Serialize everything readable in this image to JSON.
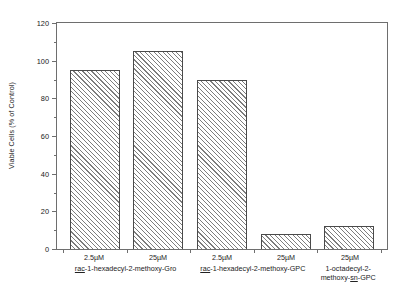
{
  "chart_data": {
    "type": "bar",
    "title": "",
    "subtitle": "",
    "xlabel": "",
    "ylabel": "Viable Cells (% of Control)",
    "ylim": [
      0,
      120
    ],
    "yticks": [
      0,
      20,
      40,
      60,
      80,
      100,
      120
    ],
    "ytick_labels": [
      "0",
      "20",
      "40",
      "60",
      "80",
      "100",
      "120"
    ],
    "grid": false,
    "legend": "none",
    "categories": [
      "2.5µM",
      "25µM",
      "2.5µM",
      "25µM",
      "25µM"
    ],
    "values": [
      95,
      105,
      90,
      8,
      12
    ],
    "bar_fill": "hatched-diagonal",
    "series": [
      {
        "name": "Viable Cells (% of Control)",
        "values": [
          95,
          105,
          90,
          8,
          12
        ]
      }
    ],
    "points": [
      {
        "dose": "2.5µM",
        "compound": "rac-1-hexadecyl-2-methoxy-Gro",
        "value": 95
      },
      {
        "dose": "25µM",
        "compound": "rac-1-hexadecyl-2-methoxy-Gro",
        "value": 105
      },
      {
        "dose": "2.5µM",
        "compound": "rac-1-hexadecyl-2-methoxy-GPC",
        "value": 90
      },
      {
        "dose": "25µM",
        "compound": "rac-1-hexadecyl-2-methoxy-GPC",
        "value": 8
      },
      {
        "dose": "25µM",
        "compound": "1-octadecyl-2-methoxy-sn-GPC",
        "value": 12
      }
    ],
    "groups": [
      {
        "label_prefix": "rac",
        "label_rest": "-1-hexadecyl-2-methoxy-Gro",
        "label_full": "rac-1-hexadecyl-2-methoxy-Gro",
        "doses": [
          "2.5µM",
          "25µM"
        ]
      },
      {
        "label_prefix": "rac",
        "label_rest": "-1-hexadecyl-2-methoxy-GPC",
        "label_full": "rac-1-hexadecyl-2-methoxy-GPC",
        "doses": [
          "2.5µM",
          "25µM"
        ]
      },
      {
        "line1": "1-octadecyl-2-",
        "line2_a": "methoxy-",
        "line2_b": "sn",
        "line2_c": "-GPC",
        "label_full": "1-octadecyl-2-methoxy-sn-GPC",
        "doses": [
          "25µM"
        ]
      }
    ],
    "colors": {
      "axis": "#6e6e6e",
      "bar_edge": "#4a4a4a",
      "hatch": "#7d7d7d",
      "background": "#ffffff",
      "text": "#222222"
    }
  }
}
